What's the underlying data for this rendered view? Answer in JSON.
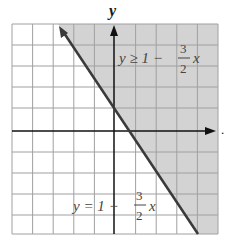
{
  "diagram": {
    "axis_labels": {
      "y": "y"
    },
    "trailing_mark": ".",
    "inequality_label": {
      "lhs": "y ≥ 1 −",
      "num": "3",
      "den": "2",
      "var": "x"
    },
    "boundary_label": {
      "lhs": "y = 1 −",
      "num": "3",
      "den": "2",
      "var": "x"
    },
    "grid": {
      "columns": 10,
      "rows": 10
    },
    "colors": {
      "shade": "#d3d3d3",
      "grid": "#9a9a9a",
      "line": "#3a3a3a",
      "axis": "#111111"
    }
  }
}
